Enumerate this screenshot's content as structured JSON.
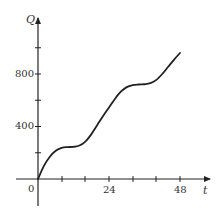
{
  "chart_data": {
    "type": "line",
    "title": "",
    "xlabel": "t",
    "ylabel": "Q",
    "origin_label": "0",
    "x_ticks": [
      12,
      24,
      36,
      48
    ],
    "x_tick_labels": {
      "24": "24",
      "48": "48"
    },
    "y_ticks": [
      200,
      400,
      600,
      800,
      1000
    ],
    "y_tick_labels": {
      "400": "400",
      "800": "800"
    },
    "xlim": [
      0,
      54
    ],
    "ylim": [
      -200,
      1150
    ],
    "grid": false,
    "series": [
      {
        "name": "Q(t)",
        "x": [
          0,
          2,
          4,
          6,
          8,
          10,
          12,
          14,
          16,
          18,
          20,
          22,
          24,
          26,
          28,
          30,
          32,
          34,
          36,
          38,
          40,
          42,
          44,
          46,
          48
        ],
        "values": [
          0,
          100,
          170,
          215,
          237,
          243,
          245,
          255,
          285,
          340,
          410,
          480,
          545,
          610,
          665,
          700,
          715,
          720,
          722,
          730,
          755,
          800,
          855,
          910,
          960
        ]
      }
    ],
    "color": "#222222"
  },
  "labels": {
    "y_axis": "Q",
    "x_axis": "t",
    "origin": "0",
    "y400": "400",
    "y800": "800",
    "x24": "24",
    "x48": "48"
  }
}
